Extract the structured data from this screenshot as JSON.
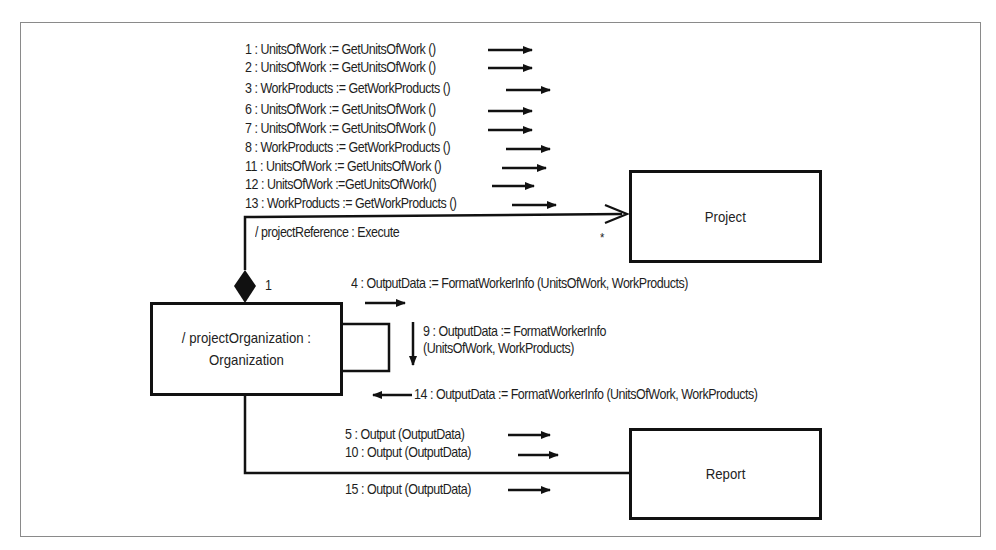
{
  "diagram": {
    "type": "UML collaboration diagram",
    "objects": {
      "project": "Project",
      "organization_line1": "/ projectOrganization :",
      "organization_line2": "Organization",
      "report": "Report"
    },
    "link_labels": {
      "project_reference": "/ projectReference : Execute",
      "multiplicity_one": "1",
      "multiplicity_many": "*"
    },
    "messages_to_project": [
      "1 : UnitsOfWork := GetUnitsOfWork ()",
      "2 : UnitsOfWork := GetUnitsOfWork ()",
      "3 : WorkProducts := GetWorkProducts ()",
      "6 : UnitsOfWork := GetUnitsOfWork ()",
      "7 : UnitsOfWork := GetUnitsOfWork ()",
      "8 : WorkProducts := GetWorkProducts ()",
      "11 : UnitsOfWork := GetUnitsOfWork ()",
      "12 : UnitsOfWork :=GetUnitsOfWork()",
      "13 : WorkProducts := GetWorkProducts ()"
    ],
    "self_messages": {
      "m4": "4 : OutputData := FormatWorkerInfo (UnitsOfWork, WorkProducts)",
      "m9_line1": "9 : OutputData := FormatWorkerInfo",
      "m9_line2": "(UnitsOfWork, WorkProducts)",
      "m14": "14 : OutputData := FormatWorkerInfo (UnitsOfWork, WorkProducts)"
    },
    "messages_to_report": [
      "5 : Output (OutputData)",
      "10 : Output (OutputData)",
      "15 : Output (OutputData)"
    ]
  }
}
